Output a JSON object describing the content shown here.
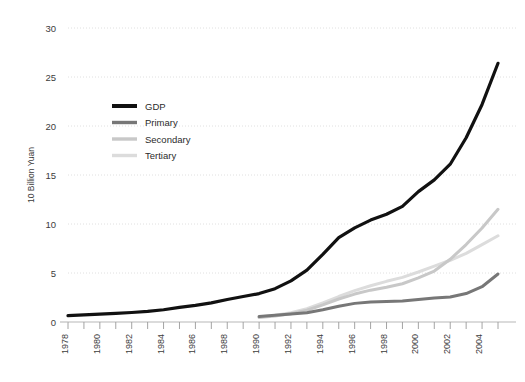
{
  "chart_data": {
    "type": "line",
    "title": "",
    "xlabel": "",
    "ylabel": "10 Billion Yuan",
    "ylim": [
      0,
      30
    ],
    "xlim": [
      1978,
      2005
    ],
    "grid": true,
    "legend_position": "upper-left-inside",
    "ytick_labels": [
      "0",
      "5",
      "10",
      "15",
      "20",
      "25",
      "30"
    ],
    "ytick_values": [
      0,
      5,
      10,
      15,
      20,
      25,
      30
    ],
    "xtick_labels": [
      "1978",
      "1980",
      "1982",
      "1984",
      "1986",
      "1988",
      "1990",
      "1992",
      "1994",
      "1996",
      "1998",
      "2000",
      "2002",
      "2004"
    ],
    "xtick_values": [
      1978,
      1980,
      1982,
      1984,
      1986,
      1988,
      1990,
      1992,
      1994,
      1996,
      1998,
      2000,
      2002,
      2004
    ],
    "x": [
      1978,
      1979,
      1980,
      1981,
      1982,
      1983,
      1984,
      1985,
      1986,
      1987,
      1988,
      1989,
      1990,
      1991,
      1992,
      1993,
      1994,
      1995,
      1996,
      1997,
      1998,
      1999,
      2000,
      2001,
      2002,
      2003,
      2004,
      2005
    ],
    "series": [
      {
        "name": "GDP",
        "color": "#111111",
        "width": 3.2,
        "values": [
          0.65,
          0.72,
          0.8,
          0.88,
          0.97,
          1.08,
          1.25,
          1.5,
          1.7,
          1.95,
          2.3,
          2.6,
          2.9,
          3.4,
          4.2,
          5.3,
          6.9,
          8.6,
          9.6,
          10.4,
          11.0,
          11.8,
          13.3,
          14.5,
          16.1,
          18.8,
          22.2,
          26.4
        ]
      },
      {
        "name": "Primary",
        "color": "#777777",
        "width": 3.0,
        "values": [
          null,
          null,
          null,
          null,
          null,
          null,
          null,
          null,
          null,
          null,
          null,
          null,
          0.55,
          0.7,
          0.82,
          0.95,
          1.25,
          1.6,
          1.9,
          2.05,
          2.1,
          2.15,
          2.3,
          2.45,
          2.55,
          2.9,
          3.6,
          4.9
        ]
      },
      {
        "name": "Secondary",
        "color": "#c8c8c8",
        "width": 3.0,
        "values": [
          null,
          null,
          null,
          null,
          null,
          null,
          null,
          null,
          null,
          null,
          null,
          null,
          0.45,
          0.62,
          0.85,
          1.2,
          1.75,
          2.35,
          2.85,
          3.25,
          3.55,
          3.9,
          4.5,
          5.2,
          6.4,
          7.9,
          9.6,
          11.5
        ]
      },
      {
        "name": "Tertiary",
        "color": "#dcdcdc",
        "width": 3.0,
        "values": [
          null,
          null,
          null,
          null,
          null,
          null,
          null,
          null,
          null,
          null,
          null,
          null,
          0.5,
          0.68,
          0.95,
          1.35,
          1.95,
          2.6,
          3.2,
          3.7,
          4.15,
          4.55,
          5.1,
          5.7,
          6.3,
          7.0,
          7.9,
          8.8
        ]
      }
    ],
    "legend": [
      {
        "label": "GDP",
        "color": "#111111"
      },
      {
        "label": "Primary",
        "color": "#777777"
      },
      {
        "label": "Secondary",
        "color": "#c8c8c8"
      },
      {
        "label": "Tertiary",
        "color": "#dcdcdc"
      }
    ]
  }
}
